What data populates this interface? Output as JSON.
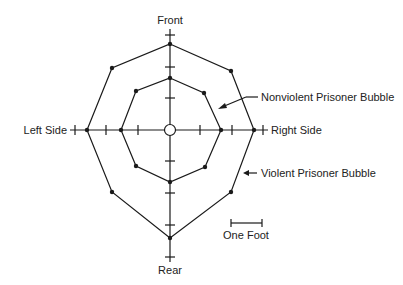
{
  "diagram": {
    "axis_labels": {
      "front": "Front",
      "rear": "Rear",
      "left": "Left Side",
      "right": "Right Side"
    },
    "annotations": {
      "nonviolent": "Nonviolent Prisoner Bubble",
      "violent": "Violent Prisoner Bubble",
      "scale": "One Foot"
    },
    "scale_unit_px": 31,
    "colors": {
      "line": "#1a1a1a",
      "background": "#ffffff"
    },
    "bubbles": {
      "violent_feet": {
        "front": 2.8,
        "front_right": 2.7,
        "right": 2.7,
        "rear_right": 2.8,
        "rear": 3.5,
        "rear_left": 2.8,
        "left": 2.7,
        "front_left": 2.7
      },
      "nonviolent_feet": {
        "front": 1.7,
        "front_right": 1.7,
        "right": 1.6,
        "rear_right": 1.7,
        "rear": 1.7,
        "rear_left": 1.7,
        "left": 1.6,
        "front_left": 1.7
      }
    }
  }
}
